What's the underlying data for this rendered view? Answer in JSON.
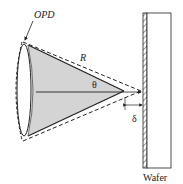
{
  "labels": {
    "opd": "OPD",
    "radius": "R",
    "angle": "θ",
    "gap": "δ",
    "wafer": "Wafer"
  },
  "colors": {
    "cone_fill": "#d4d4d4",
    "stroke": "#222222",
    "background": "#ffffff"
  }
}
